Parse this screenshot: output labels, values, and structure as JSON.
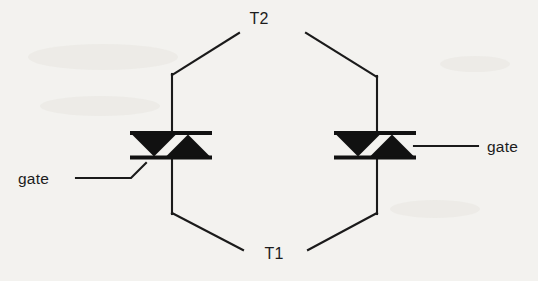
{
  "diagram": {
    "title_visible": false,
    "background_color": "#f3f2ef",
    "ink_color": "#111111",
    "terminals": {
      "top": "T2",
      "bottom": "T1"
    },
    "gate_left_label": "gate",
    "gate_right_label": "gate",
    "devices": [
      {
        "id": "left-triac",
        "name": "triac-left",
        "gate_side": "left",
        "gate_label": "gate",
        "top_bar": {
          "x1": 130,
          "x2": 212,
          "y": 133
        },
        "bottom_bar": {
          "x1": 130,
          "x2": 212,
          "y": 157.5
        },
        "triangle_down": {
          "points": "132,134.5 176,134.5 154,156.5"
        },
        "triangle_up": {
          "points": "166,156.5 210,156.5 188,134.5"
        },
        "stem_x": 172,
        "stem_top_y": 74,
        "stem_bottom_y": 214
      },
      {
        "id": "right-triac",
        "name": "triac-right",
        "gate_side": "right",
        "gate_label": "gate",
        "top_bar": {
          "x1": 334,
          "x2": 416,
          "y": 133
        },
        "bottom_bar": {
          "x1": 334,
          "x2": 416,
          "y": 157.5
        },
        "triangle_down": {
          "points": "336,134.5 380,134.5 358,156.5"
        },
        "triangle_up": {
          "points": "370,156.5 414,156.5 392,134.5"
        },
        "stem_x": 377,
        "stem_top_y": 76,
        "stem_bottom_y": 214
      }
    ],
    "wires": [
      {
        "id": "top-left-diagonal",
        "name": "wire-t2-to-left-triac",
        "d": "M 239,33 L 172,75"
      },
      {
        "id": "left-upper-vertical",
        "name": "wire-left-upper-stem",
        "d": "M 172,74 L 172,133"
      },
      {
        "id": "left-lower-vertical",
        "name": "wire-left-lower-stem",
        "d": "M 172,157 L 172,214"
      },
      {
        "id": "bottom-left-diagonal",
        "name": "wire-left-triac-to-t1",
        "d": "M 172,213 L 243,250"
      },
      {
        "id": "top-right-diagonal",
        "name": "wire-t2-to-right-triac",
        "d": "M 306,33 L 377,77"
      },
      {
        "id": "right-upper-vertical",
        "name": "wire-right-upper-stem",
        "d": "M 377,76 L 377,133"
      },
      {
        "id": "right-lower-vertical",
        "name": "wire-right-lower-stem",
        "d": "M 377,157 L 377,214"
      },
      {
        "id": "bottom-right-diagonal",
        "name": "wire-right-triac-to-t1",
        "d": "M 377,213 L 308,250"
      },
      {
        "id": "gate-left-lead",
        "name": "wire-gate-left",
        "d": "M 76,178 L 131,178 L 146,163"
      },
      {
        "id": "gate-right-lead",
        "name": "wire-gate-right",
        "d": "M 414,146 L 478,146"
      }
    ],
    "labels": [
      {
        "id": "t2",
        "name": "terminal-label-t2",
        "text": "T2",
        "x": 259,
        "y": 24,
        "anchor": "middle"
      },
      {
        "id": "t1",
        "name": "terminal-label-t1",
        "text": "T1",
        "x": 274,
        "y": 259,
        "anchor": "middle"
      },
      {
        "id": "gate-left",
        "name": "gate-label-left",
        "text": "gate",
        "x": 18,
        "y": 184,
        "anchor": "start"
      },
      {
        "id": "gate-right",
        "name": "gate-label-right",
        "text": "gate",
        "x": 487,
        "y": 152,
        "anchor": "start"
      }
    ]
  }
}
